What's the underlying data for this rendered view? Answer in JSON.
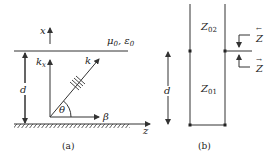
{
  "panel_a": {
    "caption": "(a)",
    "x_axis": "x",
    "z_axis": "z",
    "upper_medium": "μ",
    "upper_medium_sub": "0",
    "upper_medium_eps": "ε",
    "upper_medium_eps_sub": "0",
    "lower_medium": "μ, ε",
    "kx_base": "k",
    "kx_sub": "x",
    "k_label": "k",
    "theta": "θ",
    "beta": "β",
    "thickness": "d"
  },
  "panel_b": {
    "caption": "(b)",
    "z02_base": "Z",
    "z02_sub": "02",
    "z01_base": "Z",
    "z01_sub": "01",
    "thickness": "d",
    "z_left": "Z",
    "z_left_arrow": "←",
    "z_right": "Z",
    "z_right_arrow": "→"
  }
}
